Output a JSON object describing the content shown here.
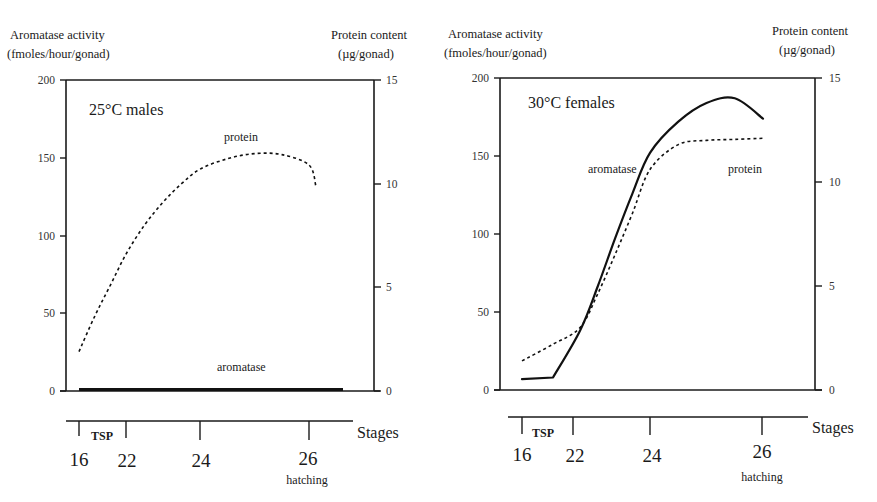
{
  "figure": {
    "panels": [
      {
        "id": "males",
        "title": "25°C males",
        "left_axis": {
          "title_line1": "Aromatase activity",
          "title_line2": "(fmoles/hour/gonad)",
          "ticks": [
            "0",
            "50",
            "100",
            "150",
            "200"
          ]
        },
        "right_axis": {
          "title_line1": "Protein content",
          "title_line2": "(µg/gonad)",
          "ticks": [
            "0",
            "5",
            "10",
            "15"
          ]
        },
        "series_labels": {
          "protein": "protein",
          "aromatase": "aromatase"
        },
        "stage_axis": {
          "label": "Stages",
          "ticks": [
            "16",
            "22",
            "24",
            "26"
          ],
          "tsp_label": "TSP",
          "hatching_label": "hatching"
        }
      },
      {
        "id": "females",
        "title": "30°C females",
        "left_axis": {
          "title_line1": "Aromatase activity",
          "title_line2": "(fmoles/hour/gonad)",
          "ticks": [
            "0",
            "50",
            "100",
            "150",
            "200"
          ]
        },
        "right_axis": {
          "title_line1": "Protein content",
          "title_line2": "(µg/gonad)",
          "ticks": [
            "0",
            "5",
            "10",
            "15"
          ]
        },
        "series_labels": {
          "protein": "protein",
          "aromatase": "aromatase"
        },
        "stage_axis": {
          "label": "Stages",
          "ticks": [
            "16",
            "22",
            "24",
            "26"
          ],
          "tsp_label": "TSP",
          "hatching_label": "hatching"
        }
      }
    ]
  },
  "chart_data": [
    {
      "type": "line",
      "title": "25°C males",
      "xlabel": "Stages",
      "x_ticks": [
        "16",
        "22",
        "24",
        "26"
      ],
      "x_annotations": [
        {
          "text": "TSP",
          "span": [
            "16",
            "22"
          ]
        },
        {
          "text": "hatching",
          "at": "26"
        }
      ],
      "ylabel": "Aromatase activity (fmoles/hour/gonad)",
      "ylim": [
        0,
        200
      ],
      "y_ticks": [
        0,
        50,
        100,
        150,
        200
      ],
      "y2label": "Protein content (µg/gonad)",
      "y2lim": [
        0,
        15
      ],
      "y2_ticks": [
        0,
        5,
        10,
        15
      ],
      "grid": false,
      "series": [
        {
          "name": "aromatase",
          "axis": "left",
          "style": "solid-thick",
          "x": [
            16,
            18,
            20,
            22,
            23,
            24,
            25,
            26,
            26.5
          ],
          "values": [
            1,
            1,
            1,
            1,
            1,
            1,
            1,
            1,
            1
          ]
        },
        {
          "name": "protein",
          "axis": "right",
          "style": "dotted",
          "x": [
            16,
            18,
            20,
            22,
            22.5,
            23,
            23.5,
            24,
            24.5,
            25,
            25.5,
            26,
            26.1
          ],
          "values": [
            1.9,
            3.6,
            5.1,
            6.6,
            8.0,
            9.1,
            10.0,
            10.7,
            11.2,
            11.45,
            11.4,
            10.9,
            9.9
          ]
        }
      ]
    },
    {
      "type": "line",
      "title": "30°C females",
      "xlabel": "Stages",
      "x_ticks": [
        "16",
        "22",
        "24",
        "26"
      ],
      "x_annotations": [
        {
          "text": "TSP",
          "span": [
            "16",
            "22"
          ]
        },
        {
          "text": "hatching",
          "at": "26"
        }
      ],
      "ylabel": "Aromatase activity (fmoles/hour/gonad)",
      "ylim": [
        0,
        200
      ],
      "y_ticks": [
        0,
        50,
        100,
        150,
        200
      ],
      "y2label": "Protein content (µg/gonad)",
      "y2lim": [
        0,
        15
      ],
      "y2_ticks": [
        0,
        5,
        10,
        15
      ],
      "grid": false,
      "series": [
        {
          "name": "aromatase",
          "axis": "left",
          "style": "solid",
          "x": [
            16,
            20,
            22,
            22.5,
            23,
            23.5,
            24,
            24.5,
            25,
            25.5,
            26
          ],
          "values": [
            7,
            8,
            38,
            66,
            97,
            126,
            152,
            172,
            184,
            187,
            174
          ]
        },
        {
          "name": "protein",
          "axis": "right",
          "style": "dotted",
          "x": [
            16,
            20,
            22,
            22.5,
            23,
            23.5,
            24,
            24.5,
            25,
            25.5,
            26
          ],
          "values": [
            1.4,
            2.2,
            3.0,
            4.6,
            6.5,
            8.5,
            10.6,
            11.8,
            12.0,
            12.05,
            12.1
          ]
        }
      ]
    }
  ]
}
